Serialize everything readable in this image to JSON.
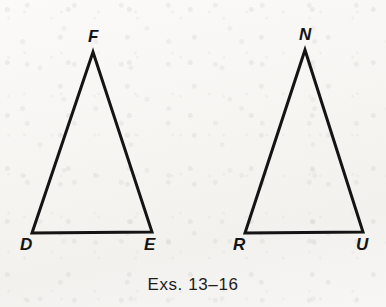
{
  "figure": {
    "caption": "Exs. 13–16",
    "background_color": "#f7f6f3",
    "stroke_color": "#141414",
    "stroke_width": 3,
    "triangles": [
      {
        "name": "triangle-def",
        "vertices": [
          {
            "label": "D",
            "x": 32,
            "y": 233,
            "label_x": 20,
            "label_y": 236
          },
          {
            "label": "E",
            "x": 152,
            "y": 232,
            "label_x": 144,
            "label_y": 236
          },
          {
            "label": "F",
            "x": 93,
            "y": 52,
            "label_x": 88,
            "label_y": 28
          }
        ]
      },
      {
        "name": "triangle-rnu",
        "vertices": [
          {
            "label": "R",
            "x": 245,
            "y": 233,
            "label_x": 233,
            "label_y": 236
          },
          {
            "label": "U",
            "x": 363,
            "y": 232,
            "label_x": 356,
            "label_y": 236
          },
          {
            "label": "N",
            "x": 305,
            "y": 50,
            "label_x": 299,
            "label_y": 26
          }
        ]
      }
    ]
  }
}
